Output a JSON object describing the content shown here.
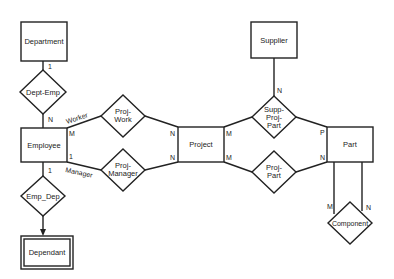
{
  "diagram": {
    "type": "entity-relationship",
    "entities": [
      {
        "id": "department",
        "label": "Department",
        "weak": false
      },
      {
        "id": "employee",
        "label": "Employee",
        "weak": false
      },
      {
        "id": "dependant",
        "label": "Dependant",
        "weak": true
      },
      {
        "id": "project",
        "label": "Project",
        "weak": false
      },
      {
        "id": "supplier",
        "label": "Supplier",
        "weak": false
      },
      {
        "id": "part",
        "label": "Part",
        "weak": false
      }
    ],
    "relationships": [
      {
        "id": "dept_emp",
        "label": "Dept-Emp"
      },
      {
        "id": "emp_dep",
        "label": "Emp_Dep"
      },
      {
        "id": "proj_work",
        "label_line1": "Proj-",
        "label_line2": "Work"
      },
      {
        "id": "proj_manager",
        "label_line1": "Proj-",
        "label_line2": "Manager"
      },
      {
        "id": "supp_proj_part",
        "label_line1": "Supp-",
        "label_line2": "Proj-",
        "label_line3": "Part"
      },
      {
        "id": "proj_part",
        "label_line1": "Proj-",
        "label_line2": "Part"
      },
      {
        "id": "component",
        "label": "Component"
      }
    ],
    "cardinalities": {
      "department_dept_emp": "1",
      "employee_dept_emp": "N",
      "employee_proj_work": "M",
      "employee_proj_manager": "1",
      "employee_emp_dep": "1",
      "project_proj_work": "N",
      "project_proj_manager": "N",
      "project_supp_proj_part": "M",
      "project_proj_part": "M",
      "supplier_supp_proj_part": "N",
      "part_supp_proj_part": "P",
      "part_proj_part": "N",
      "part_component_left": "M",
      "part_component_right": "N"
    },
    "roles": {
      "worker": "Worker",
      "manager": "Manager"
    }
  }
}
